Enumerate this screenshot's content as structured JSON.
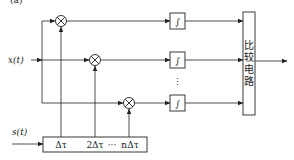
{
  "diagram": {
    "title_partial": "(a)",
    "inputs": {
      "x": "x(t)",
      "s": "s(t)"
    },
    "delay_line": {
      "taps": [
        "Δτ",
        "2Δτ",
        "···",
        "nΔτ"
      ]
    },
    "multipliers": [
      {
        "symbol": "⊗"
      },
      {
        "symbol": "⊗"
      },
      {
        "symbol": "⊗"
      }
    ],
    "integrators": [
      {
        "symbol": "∫"
      },
      {
        "symbol": "∫"
      },
      {
        "symbol": "∫"
      }
    ],
    "ellipsis_vertical": "⋮",
    "comparator": {
      "label_chars": [
        "比",
        "较",
        "电",
        "路"
      ],
      "label": "比较电路"
    },
    "colors": {
      "line": "#222222",
      "background": "#ffffff"
    }
  }
}
